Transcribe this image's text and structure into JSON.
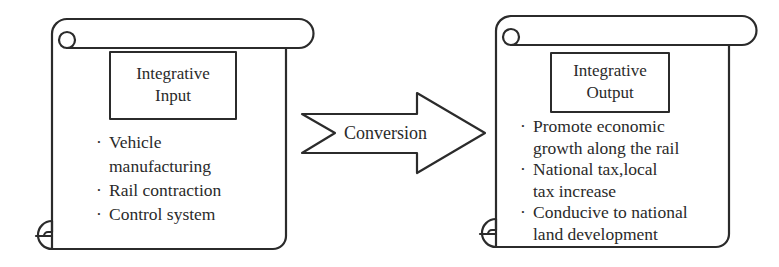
{
  "input_scroll": {
    "title_line1": "Integrative",
    "title_line2": "Input",
    "items": [
      {
        "lines": [
          "Vehicle",
          "manufacturing"
        ]
      },
      {
        "lines": [
          "Rail contraction"
        ]
      },
      {
        "lines": [
          "Control system"
        ]
      }
    ]
  },
  "conversion_arrow": {
    "label": "Conversion"
  },
  "output_scroll": {
    "title_line1": "Integrative",
    "title_line2": "Output",
    "items": [
      {
        "lines": [
          "Promote economic",
          "growth along the rail"
        ]
      },
      {
        "lines": [
          "National tax,local",
          "tax increase"
        ]
      },
      {
        "lines": [
          "Conducive to national",
          "land development"
        ]
      }
    ]
  },
  "bullet_glyph": "·",
  "colors": {
    "stroke": "#2b2b2b",
    "background": "#ffffff",
    "text": "#2a2a2a"
  }
}
